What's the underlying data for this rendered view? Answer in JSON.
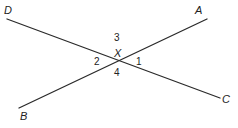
{
  "diagram": {
    "type": "intersecting-lines",
    "intersection_label": "X",
    "lines": [
      {
        "name": "DC",
        "from": "D",
        "to": "C"
      },
      {
        "name": "BA",
        "from": "B",
        "to": "A"
      }
    ],
    "points": {
      "D": "D",
      "A": "A",
      "B": "B",
      "C": "C",
      "X": "X"
    },
    "angles": {
      "a1": "1",
      "a2": "2",
      "a3": "3",
      "a4": "4"
    },
    "colors": {
      "stroke": "#2a2a2a",
      "text": "#222222",
      "background": "#ffffff"
    }
  }
}
